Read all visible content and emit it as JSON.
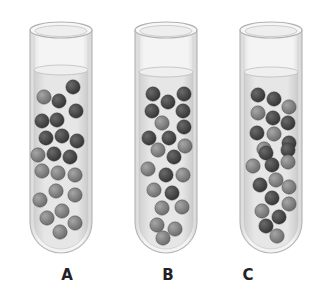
{
  "figure": {
    "background": "#ffffff",
    "colors": {
      "glass_edge": "#b8b8b8",
      "glass_fill": "#f1f1f1",
      "liquid": "#e2e2e2",
      "liquid_surface": "#efefef",
      "ball_dark": "#4a4a4a",
      "ball_light": "#858585"
    }
  },
  "tubes": [
    {
      "label": "A",
      "x": 30,
      "width": 62,
      "top": 30,
      "bottom": 253,
      "liquid_top": 70,
      "balls": [
        [
          73,
          87,
          "d"
        ],
        [
          44,
          97,
          "l"
        ],
        [
          59,
          101,
          "d"
        ],
        [
          76,
          111,
          "d"
        ],
        [
          42,
          121,
          "d"
        ],
        [
          57,
          120,
          "d"
        ],
        [
          46,
          138,
          "d"
        ],
        [
          62,
          136,
          "d"
        ],
        [
          77,
          141,
          "d"
        ],
        [
          38,
          155,
          "l"
        ],
        [
          54,
          154,
          "d"
        ],
        [
          70,
          157,
          "d"
        ],
        [
          42,
          171,
          "l"
        ],
        [
          58,
          173,
          "l"
        ],
        [
          75,
          175,
          "l"
        ],
        [
          56,
          191,
          "l"
        ],
        [
          75,
          195,
          "l"
        ],
        [
          40,
          200,
          "l"
        ],
        [
          62,
          211,
          "l"
        ],
        [
          47,
          218,
          "l"
        ],
        [
          75,
          223,
          "l"
        ],
        [
          60,
          232,
          "l"
        ]
      ]
    },
    {
      "label": "B",
      "x": 135,
      "width": 62,
      "top": 30,
      "bottom": 253,
      "liquid_top": 72,
      "balls": [
        [
          153,
          94,
          "d"
        ],
        [
          168,
          102,
          "d"
        ],
        [
          184,
          94,
          "d"
        ],
        [
          152,
          111,
          "d"
        ],
        [
          183,
          111,
          "d"
        ],
        [
          162,
          123,
          "l"
        ],
        [
          184,
          127,
          "d"
        ],
        [
          149,
          138,
          "d"
        ],
        [
          169,
          138,
          "d"
        ],
        [
          185,
          146,
          "l"
        ],
        [
          158,
          150,
          "l"
        ],
        [
          174,
          157,
          "d"
        ],
        [
          148,
          169,
          "l"
        ],
        [
          166,
          175,
          "d"
        ],
        [
          183,
          175,
          "l"
        ],
        [
          154,
          190,
          "l"
        ],
        [
          172,
          193,
          "d"
        ],
        [
          162,
          208,
          "l"
        ],
        [
          182,
          207,
          "l"
        ],
        [
          157,
          225,
          "l"
        ],
        [
          175,
          229,
          "l"
        ],
        [
          163,
          238,
          "l"
        ]
      ]
    },
    {
      "label": "C",
      "x": 240,
      "width": 62,
      "top": 30,
      "bottom": 253,
      "liquid_top": 72,
      "balls": [
        [
          258,
          95,
          "d"
        ],
        [
          274,
          99,
          "d"
        ],
        [
          289,
          107,
          "l"
        ],
        [
          258,
          113,
          "l"
        ],
        [
          273,
          118,
          "d"
        ],
        [
          288,
          123,
          "d"
        ],
        [
          257,
          133,
          "d"
        ],
        [
          274,
          134,
          "l"
        ],
        [
          289,
          143,
          "d"
        ],
        [
          264,
          149,
          "l"
        ],
        [
          266,
          153,
          "d"
        ],
        [
          288,
          150,
          "d"
        ],
        [
          253,
          166,
          "l"
        ],
        [
          272,
          165,
          "d"
        ],
        [
          288,
          162,
          "l"
        ],
        [
          260,
          185,
          "d"
        ],
        [
          276,
          180,
          "l"
        ],
        [
          289,
          187,
          "l"
        ],
        [
          272,
          198,
          "d"
        ],
        [
          289,
          204,
          "l"
        ],
        [
          262,
          211,
          "l"
        ],
        [
          279,
          217,
          "d"
        ],
        [
          266,
          226,
          "d"
        ],
        [
          277,
          236,
          "l"
        ]
      ]
    }
  ],
  "labels": [
    {
      "text": "A",
      "x": 57
    },
    {
      "text": "B",
      "x": 158
    },
    {
      "text": "C",
      "x": 238
    }
  ]
}
